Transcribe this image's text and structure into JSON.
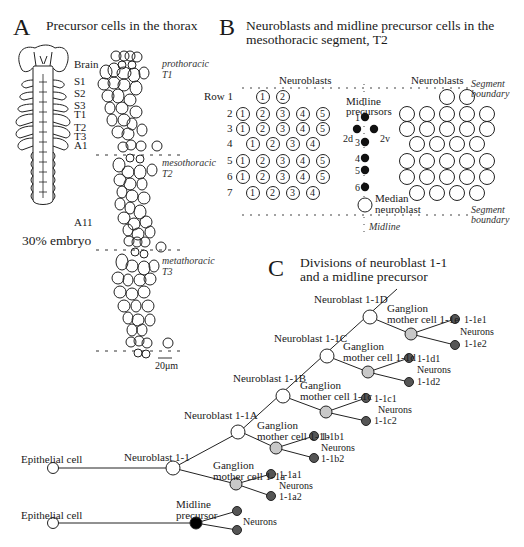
{
  "panel_a": {
    "letter": "A",
    "title": "Precursor cells in the thorax",
    "embryo_labels": [
      "Brain",
      "S1",
      "S2",
      "S3",
      "T1",
      "T2",
      "T3",
      "A1",
      "A11"
    ],
    "embryo_caption": "30% embryo",
    "segment_labels": [
      {
        "name": "prothoracic",
        "code": "T1"
      },
      {
        "name": "mesothoracic",
        "code": "T2"
      },
      {
        "name": "metathoracic",
        "code": "T3"
      }
    ],
    "scale_bar": "20μm"
  },
  "panel_b": {
    "letter": "B",
    "title_line1": "Neuroblasts and  midline precursor cells in the",
    "title_line2": "mesothoracic segment, T2",
    "left_header": "Neuroblasts",
    "right_header": "Neuroblasts",
    "segment_boundary_top": [
      "Segment",
      "boundary"
    ],
    "segment_boundary_bottom": [
      "Segment",
      "boundary"
    ],
    "row_labels": [
      "Row 1",
      "2",
      "3",
      "4",
      "5",
      "6",
      "7"
    ],
    "rows": [
      [
        "1",
        "2"
      ],
      [
        "1",
        "2",
        "3",
        "4",
        "5"
      ],
      [
        "1",
        "2",
        "3",
        "4",
        "5"
      ],
      [
        "1",
        "2",
        "3",
        "4"
      ],
      [
        "1",
        "2",
        "3",
        "4",
        "5"
      ],
      [
        "1",
        "2",
        "3",
        "4",
        "5"
      ],
      [
        "1",
        "2",
        "3",
        "4"
      ]
    ],
    "midline_label": [
      "Midline",
      "precursors"
    ],
    "midline_numbers": [
      "1",
      "2d",
      "2v",
      "3",
      "4",
      "5",
      "6"
    ],
    "median_neuroblast": [
      "Median",
      "neuroblast"
    ],
    "midline_axis": "Midline"
  },
  "panel_c": {
    "letter": "C",
    "title_line1": "Divisions of neuroblast 1-1",
    "title_line2": "and a midline precursor",
    "neuroblasts": [
      "Neuroblast 1-1",
      "Neuroblast 1-1A",
      "Neuroblast 1-1B",
      "Neuroblast 1-1C",
      "Neuroblast 1-1D"
    ],
    "gmc_prefix": "Ganglion",
    "gmcs": [
      "mother cell 1-1a",
      "mother cell 1-1b",
      "mother cell 1-1c",
      "mother cell 1-1d",
      "mother cell 1-1e"
    ],
    "neuron_pairs": [
      [
        "1-1a1",
        "1-1a2"
      ],
      [
        "1-1b1",
        "1-1b2"
      ],
      [
        "1-1c1",
        "1-1c2"
      ],
      [
        "1-1d1",
        "1-1d2"
      ],
      [
        "1-1e1",
        "1-1e2"
      ]
    ],
    "neurons_label": "Neurons",
    "epithelial_cell": "Epithelial cell",
    "midline_precursor": [
      "Midline",
      "precursor"
    ],
    "colors": {
      "neuroblast": "#ffffff",
      "gmc": "#c8c8c8",
      "neuron": "#555555",
      "midline": "#000000"
    }
  }
}
